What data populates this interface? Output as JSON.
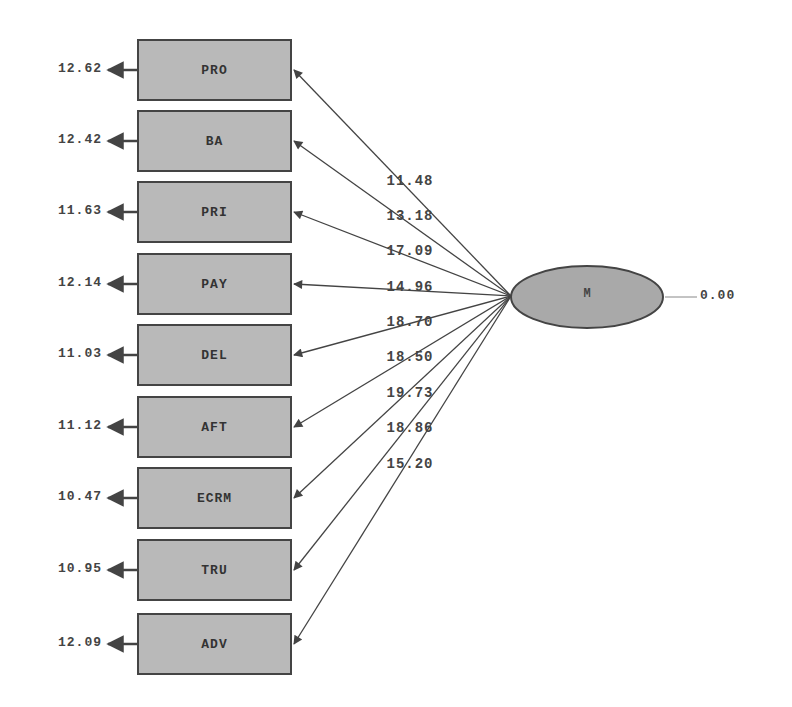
{
  "diagram": {
    "type": "path-diagram",
    "latent": {
      "name": "M",
      "variance": "0.00",
      "fill": "#a9a9a9",
      "cx": 587,
      "cy": 297,
      "rx": 76,
      "ry": 31
    },
    "indicators": [
      {
        "name": "PRO",
        "error": "12.62",
        "coef": "11.48",
        "top": 39
      },
      {
        "name": "BA",
        "error": "12.42",
        "coef": "13.18",
        "top": 110
      },
      {
        "name": "PRI",
        "error": "11.63",
        "coef": "17.09",
        "top": 181
      },
      {
        "name": "PAY",
        "error": "12.14",
        "coef": "14.96",
        "top": 253
      },
      {
        "name": "DEL",
        "error": "11.03",
        "coef": "18.70",
        "top": 324
      },
      {
        "name": "AFT",
        "error": "11.12",
        "coef": "18.50",
        "top": 396
      },
      {
        "name": "ECRM",
        "error": "10.47",
        "coef": "19.73",
        "top": 467
      },
      {
        "name": "TRU",
        "error": "10.95",
        "coef": "18.86",
        "top": 539
      },
      {
        "name": "ADV",
        "error": "12.09",
        "coef": "15.20",
        "top": 613
      }
    ],
    "coef_label_tops": [
      173,
      208,
      243,
      279,
      314,
      349,
      385,
      420,
      456
    ],
    "colors": {
      "box_fill": "#b9b9b9",
      "stroke": "#444444",
      "text": "#444444"
    }
  }
}
